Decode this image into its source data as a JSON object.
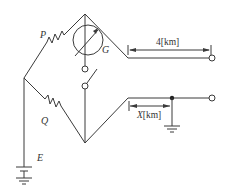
{
  "diagram": {
    "type": "Wheatstone bridge fault location circuit (Murray loop)",
    "components": {
      "resistor_p": {
        "label": "P"
      },
      "resistor_q": {
        "label": "Q"
      },
      "galvanometer": {
        "label": "G"
      },
      "battery": {
        "label": "E"
      },
      "switch": {
        "label": ""
      }
    },
    "dimensions": {
      "line_length": {
        "value": "4",
        "unit": "[km]",
        "text": "4[km]"
      },
      "fault_distance": {
        "var": "X",
        "unit": "[km]"
      }
    },
    "colors": {
      "line": "#3a3a3a",
      "background": "#ffffff"
    }
  }
}
